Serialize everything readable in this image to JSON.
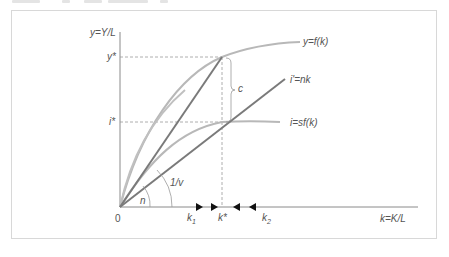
{
  "figure": {
    "type": "Solow growth model diagram",
    "axes": {
      "y_label": "y=Y/L",
      "x_label": "k=K/L",
      "origin_label": "0"
    },
    "curves": [
      {
        "id": "output",
        "label": "y=f(k)",
        "color": "#b3b3b3"
      },
      {
        "id": "investment-line",
        "label": "i'=nk",
        "color": "#7a7a7a"
      },
      {
        "id": "savings",
        "label": "i=sf(k)",
        "color": "#b3b3b3"
      }
    ],
    "levels": {
      "y_star": "y*",
      "i_star": "i*",
      "consumption": "c"
    },
    "angles": {
      "n": "n",
      "one_over_v": "1/v"
    },
    "k_points": {
      "k1": "k",
      "k1_sub": "1",
      "k_star": "k*",
      "k2": "k",
      "k2_sub": "2"
    },
    "colors": {
      "axis": "#8a8a8a",
      "light_curve": "#b8b8b8",
      "dark_line": "#7a7a7a",
      "dashed": "#9a9a9a",
      "arrow": "#111111",
      "frame": "#d8d8d8"
    }
  }
}
